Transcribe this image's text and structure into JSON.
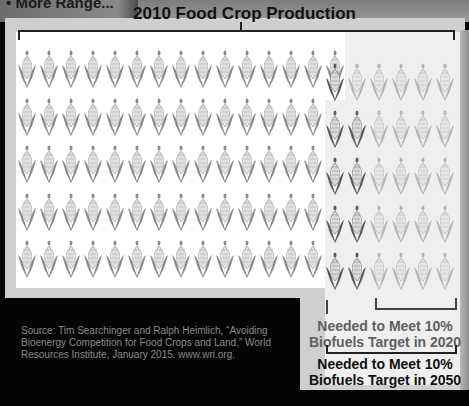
{
  "header": {
    "cropped_title": "• More Range..."
  },
  "title": "2010 Food Crop Production",
  "grid": {
    "left_rows": 5,
    "row1_white_count": 15,
    "rows2to5_white_count": 14,
    "right_rows": [
      {
        "dark": 1,
        "light": 5
      },
      {
        "dark": 2,
        "light": 4
      },
      {
        "dark": 2,
        "light": 4
      },
      {
        "dark": 2,
        "light": 4
      },
      {
        "dark": 2,
        "light": 4
      }
    ],
    "colors": {
      "base_corn": "#8a8a8a",
      "dark_corn": "#5a5a5a",
      "light_corn": "#b5b5b5",
      "white_panel": "#ffffff",
      "grey_panel": "#efefef"
    }
  },
  "labels": {
    "target_2020_line1": "Needed to Meet 10%",
    "target_2020_line2": "Biofuels Target in 2020",
    "target_2050_line1": "Needed to Meet 10%",
    "target_2050_line2": "Biofuels Target in 2050"
  },
  "source": {
    "text": "Source: Tim Searchinger and Ralph Heimlich, “Avoiding Bioenergy Competition for Food Crops and Land.” World Resources Institute, January 2015. www.wri.org."
  }
}
